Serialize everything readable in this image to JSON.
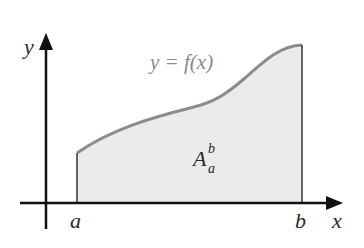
{
  "diagram": {
    "axes": {
      "x_label": "x",
      "y_label": "y"
    },
    "function_label": "y = f(x)",
    "area_label": {
      "base": "A",
      "superscript": "b",
      "subscript": "a"
    },
    "bounds": {
      "lower": "a",
      "upper": "b"
    },
    "colors": {
      "axis": "#111111",
      "curve": "#8c8c8c",
      "fill": "#ebebeb",
      "bound_lines": "#333333",
      "function_label": "#8a8a8a"
    }
  }
}
